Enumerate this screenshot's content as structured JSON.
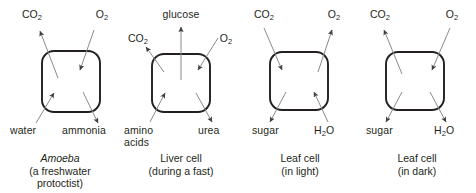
{
  "figure": {
    "type": "biology-cell-exchange-diagram",
    "stroke_color": "#231f20",
    "arrow_color": "#3f3f3f",
    "background": "#ffffff",
    "cell_count": 4
  },
  "panels": [
    {
      "id": "amoeba",
      "caption_line1": "Amoeba",
      "caption_line1_style": "italic",
      "caption_line2": "(a freshwater",
      "caption_line3": "protoctist)",
      "labels": {
        "top_left": "CO",
        "top_left_sub": "2",
        "top_right": "O",
        "top_right_sub": "2",
        "bottom_left": "water",
        "bottom_right": "ammonia"
      },
      "arrows": [
        {
          "name": "co2-out",
          "label": "CO2",
          "direction": "out",
          "corner": "top-left"
        },
        {
          "name": "o2-in",
          "label": "O2",
          "direction": "in",
          "corner": "top-right"
        },
        {
          "name": "water-in",
          "label": "water",
          "direction": "in",
          "corner": "bottom-left"
        },
        {
          "name": "ammonia-out",
          "label": "ammonia",
          "direction": "out",
          "corner": "bottom-right"
        }
      ]
    },
    {
      "id": "liver-cell",
      "caption_line1": "Liver cell",
      "caption_line1_style": "normal",
      "caption_line2": "(during a fast)",
      "caption_line3": "",
      "labels": {
        "top_center": "glucose",
        "top_left": "CO",
        "top_left_sub": "2",
        "top_right": "O",
        "top_right_sub": "2",
        "bottom_left": "amino",
        "bottom_left_line2": "acids",
        "bottom_right": "urea"
      },
      "arrows": [
        {
          "name": "glucose-out",
          "label": "glucose",
          "direction": "out",
          "corner": "top-center"
        },
        {
          "name": "co2-out",
          "label": "CO2",
          "direction": "out",
          "corner": "top-left"
        },
        {
          "name": "o2-in",
          "label": "O2",
          "direction": "in",
          "corner": "top-right"
        },
        {
          "name": "amino-acids-in",
          "label": "amino acids",
          "direction": "in",
          "corner": "bottom-left"
        },
        {
          "name": "urea-out",
          "label": "urea",
          "direction": "out",
          "corner": "bottom-right"
        }
      ]
    },
    {
      "id": "leaf-cell-light",
      "caption_line1": "Leaf cell",
      "caption_line1_style": "normal",
      "caption_line2": "(in light)",
      "caption_line3": "",
      "labels": {
        "top_left": "CO",
        "top_left_sub": "2",
        "top_right": "O",
        "top_right_sub": "2",
        "bottom_left": "sugar",
        "bottom_right": "H",
        "bottom_right_sub": "2",
        "bottom_right_tail": "O"
      },
      "arrows": [
        {
          "name": "co2-in",
          "label": "CO2",
          "direction": "in",
          "corner": "top-left"
        },
        {
          "name": "o2-out",
          "label": "O2",
          "direction": "out",
          "corner": "top-right"
        },
        {
          "name": "sugar-out",
          "label": "sugar",
          "direction": "out",
          "corner": "bottom-left"
        },
        {
          "name": "water-in",
          "label": "H2O",
          "direction": "in",
          "corner": "bottom-right"
        }
      ]
    },
    {
      "id": "leaf-cell-dark",
      "caption_line1": "Leaf cell",
      "caption_line1_style": "normal",
      "caption_line2": "(in dark)",
      "caption_line3": "",
      "labels": {
        "top_left": "CO",
        "top_left_sub": "2",
        "top_right": "O",
        "top_right_sub": "2",
        "bottom_left": "sugar",
        "bottom_right": "H",
        "bottom_right_sub": "2",
        "bottom_right_tail": "O"
      },
      "arrows": [
        {
          "name": "co2-out",
          "label": "CO2",
          "direction": "out",
          "corner": "top-left"
        },
        {
          "name": "o2-in",
          "label": "O2",
          "direction": "in",
          "corner": "top-right"
        },
        {
          "name": "sugar-out",
          "label": "sugar",
          "direction": "out",
          "corner": "bottom-left"
        },
        {
          "name": "water-out",
          "label": "H2O",
          "direction": "out",
          "corner": "bottom-right"
        }
      ]
    }
  ]
}
